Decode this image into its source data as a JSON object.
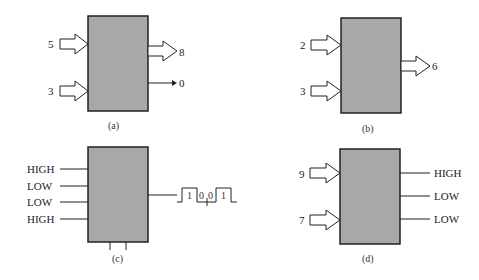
{
  "figure": {
    "panels": [
      {
        "id": "a",
        "caption": "(a)",
        "inputs": [
          {
            "label": "5",
            "type": "bus"
          },
          {
            "label": "3",
            "type": "bus"
          }
        ],
        "outputs": [
          {
            "label": "8",
            "type": "bus"
          },
          {
            "label": "0",
            "type": "line-arrow"
          }
        ]
      },
      {
        "id": "b",
        "caption": "(b)",
        "inputs": [
          {
            "label": "2",
            "type": "bus"
          },
          {
            "label": "3",
            "type": "bus"
          }
        ],
        "outputs": [
          {
            "label": "6",
            "type": "bus"
          }
        ]
      },
      {
        "id": "c",
        "caption": "(c)",
        "inputs": [
          {
            "label": "HIGH",
            "type": "line"
          },
          {
            "label": "LOW",
            "type": "line"
          },
          {
            "label": "LOW",
            "type": "line"
          },
          {
            "label": "HIGH",
            "type": "line"
          }
        ],
        "outputs": [
          {
            "label": "serial waveform",
            "type": "waveform",
            "bits": [
              "1",
              "0",
              "0",
              "1"
            ]
          }
        ],
        "bottom_pins": 2
      },
      {
        "id": "d",
        "caption": "(d)",
        "inputs": [
          {
            "label": "9",
            "type": "bus"
          },
          {
            "label": "7",
            "type": "bus"
          }
        ],
        "outputs": [
          {
            "label": "HIGH",
            "type": "line"
          },
          {
            "label": "LOW",
            "type": "line"
          },
          {
            "label": "LOW",
            "type": "line"
          }
        ]
      }
    ],
    "colors": {
      "box_fill": "#a8a8a8",
      "stroke": "#222222",
      "background": "#ffffff"
    }
  }
}
